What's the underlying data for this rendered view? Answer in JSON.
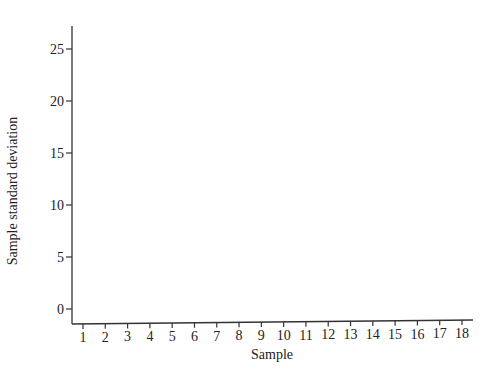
{
  "chart_data": {
    "type": "scatter",
    "title": "",
    "xlabel": "Sample",
    "ylabel": "Sample standard deviation",
    "x": [
      1,
      2,
      3,
      4,
      5,
      6,
      7,
      8,
      9,
      10,
      11,
      12,
      13,
      14,
      15,
      16,
      17,
      18
    ],
    "series": [],
    "x_ticks": [
      "1",
      "2",
      "3",
      "4",
      "5",
      "6",
      "7",
      "8",
      "9",
      "10",
      "11",
      "12",
      "13",
      "14",
      "15",
      "16",
      "17",
      "18"
    ],
    "y_ticks": [
      "0",
      "5",
      "10",
      "15",
      "20",
      "25"
    ],
    "ylim": [
      -1.5,
      27.5
    ],
    "xlim": [
      0.5,
      18.5
    ],
    "grid": false,
    "legend": null
  },
  "colors": {
    "axis": "#333333",
    "text": "#222222"
  }
}
